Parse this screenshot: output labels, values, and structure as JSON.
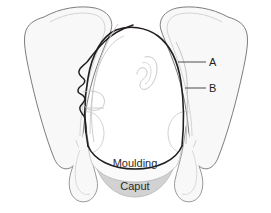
{
  "figure": {
    "background_color": "#ffffff",
    "width": 271,
    "height": 213
  },
  "annotations": {
    "label_a": "A",
    "label_b": "B",
    "band_moulding": "Moulding",
    "band_caput": "Caput"
  },
  "colors": {
    "outline_dark": "#231f20",
    "outline_light": "#9a9a9a",
    "outline_faint": "#c6c6c6",
    "pelvis_fill": "#f7f7f7",
    "pelvis_fill_shade": "#efefef",
    "moulding_fill": "#fbfbfb",
    "caput_fill": "#d2d2d2",
    "leader_line": "#3a3a3a"
  },
  "structures": {
    "left_iliac_wing": "left-iliac-wing",
    "right_iliac_wing": "right-iliac-wing",
    "left_pubic_ramus": "left-pubic-ramus",
    "right_pubic_ramus": "right-pubic-ramus",
    "fetal_head_outline": "fetal-head-outline",
    "fetal_face_profile": "fetal-face-profile",
    "fetal_ear": "fetal-ear",
    "moulding_band": "moulding-band",
    "caput_band": "caput-band"
  }
}
